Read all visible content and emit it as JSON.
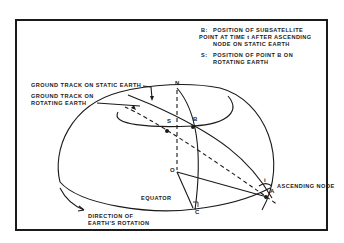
{
  "legend": {
    "b_key": "B:",
    "b_line1": "POSITION OF SUBSATELLITE",
    "b_line2": "POINT AT TIME t AFTER ASCENDING",
    "b_line3": "NODE ON STATIC EARTH",
    "s_key": "S:",
    "s_line1": "POSITION OF POINT B ON",
    "s_line2": "ROTATING EARTH"
  },
  "labels": {
    "static_track": "GROUND TRACK ON STATIC EARTH",
    "rotating_track_1": "GROUND TRACK ON",
    "rotating_track_2": "ROTATING EARTH",
    "equator": "EQUATOR",
    "rotation_1": "DIRECTION OF",
    "rotation_2": "EARTH'S ROTATION",
    "ascending_node": "ASCENDING NODE"
  },
  "points": {
    "N": "N",
    "S": "S",
    "B": "B",
    "O": "O",
    "C": "C",
    "A": "A",
    "i": "i"
  },
  "colors": {
    "ink": "#1a1a1a",
    "background": "#ffffff"
  }
}
